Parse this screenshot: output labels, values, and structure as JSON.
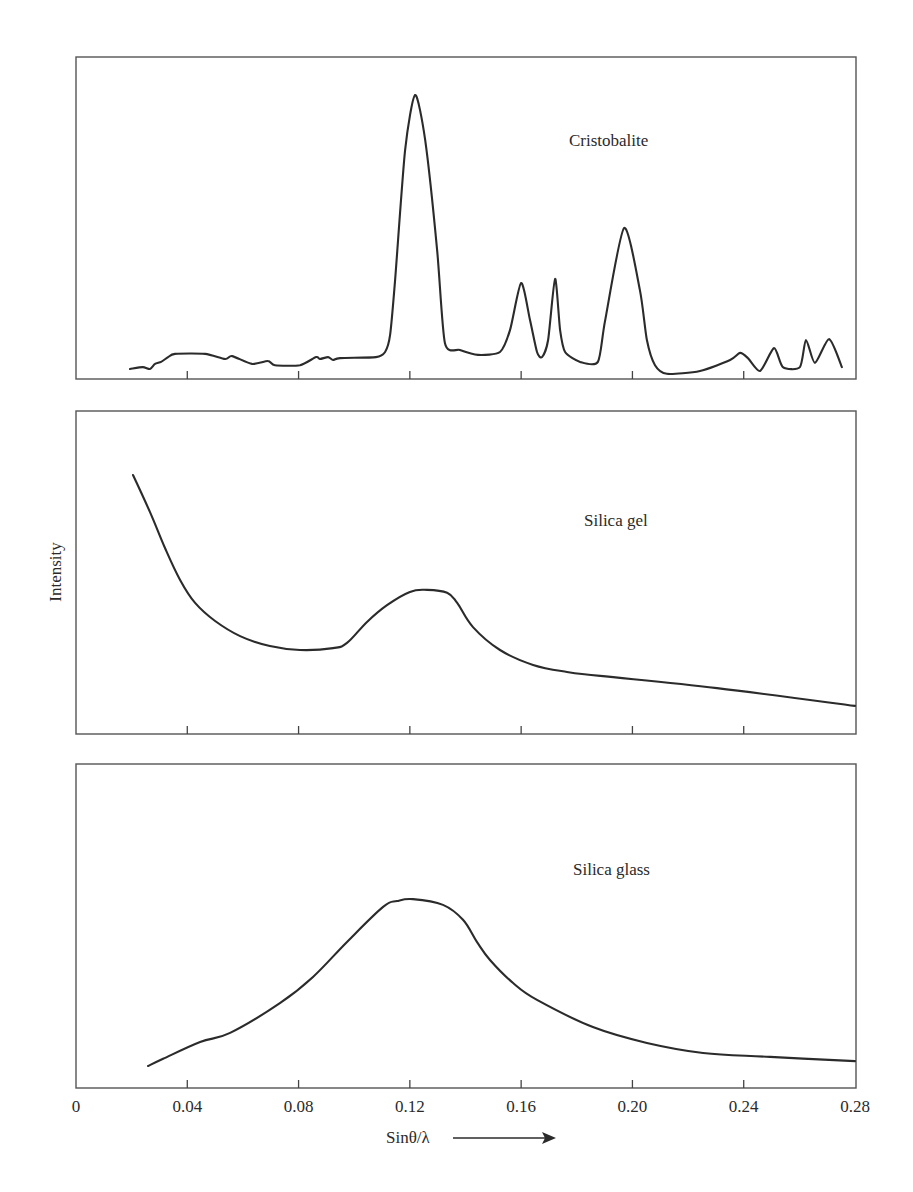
{
  "figure": {
    "ylabel": "Intensity",
    "xlabel": "Sinθ/λ",
    "xlabel_arrow": "right-arrow",
    "x_ticks": [
      "0",
      "0.04",
      "0.08",
      "0.12",
      "0.16",
      "0.20",
      "0.24",
      "0.28"
    ],
    "x_tick_values": [
      0,
      0.04,
      0.08,
      0.12,
      0.16,
      0.2,
      0.24,
      0.28
    ],
    "line_color": "#2b2b2b",
    "frame_color": "#555555"
  },
  "chart_data": {
    "type": "line",
    "title": "",
    "xlabel": "Sinθ/λ",
    "ylabel": "Intensity",
    "xlim": [
      0,
      0.28
    ],
    "ylim": [
      0,
      1
    ],
    "grid": false,
    "legend": "none (panel text labels)",
    "layout": "three vertically stacked panels sharing x-axis; y-axis unscaled relative intensity",
    "x_tick_labels": [
      "0",
      "0.04",
      "0.08",
      "0.12",
      "0.16",
      "0.20",
      "0.24",
      "0.28"
    ],
    "panels": [
      {
        "name": "Cristobalite",
        "label": "Cristobalite",
        "label_pos": [
          0.176,
          0.74
        ],
        "points": [
          [
            0.0194,
            0.031
          ],
          [
            0.024,
            0.037
          ],
          [
            0.0266,
            0.031
          ],
          [
            0.0284,
            0.047
          ],
          [
            0.0306,
            0.053
          ],
          [
            0.0331,
            0.068
          ],
          [
            0.0356,
            0.078
          ],
          [
            0.0464,
            0.078
          ],
          [
            0.0536,
            0.062
          ],
          [
            0.0561,
            0.071
          ],
          [
            0.0633,
            0.047
          ],
          [
            0.069,
            0.056
          ],
          [
            0.0715,
            0.043
          ],
          [
            0.0805,
            0.043
          ],
          [
            0.0863,
            0.068
          ],
          [
            0.0877,
            0.062
          ],
          [
            0.0906,
            0.068
          ],
          [
            0.0924,
            0.059
          ],
          [
            0.0949,
            0.065
          ],
          [
            0.1078,
            0.068
          ],
          [
            0.1111,
            0.084
          ],
          [
            0.1129,
            0.137
          ],
          [
            0.1147,
            0.307
          ],
          [
            0.1183,
            0.711
          ],
          [
            0.1219,
            0.882
          ],
          [
            0.1255,
            0.742
          ],
          [
            0.1298,
            0.401
          ],
          [
            0.1326,
            0.112
          ],
          [
            0.138,
            0.09
          ],
          [
            0.1445,
            0.075
          ],
          [
            0.1524,
            0.084
          ],
          [
            0.156,
            0.152
          ],
          [
            0.16,
            0.298
          ],
          [
            0.1632,
            0.183
          ],
          [
            0.1657,
            0.084
          ],
          [
            0.1675,
            0.068
          ],
          [
            0.1697,
            0.121
          ],
          [
            0.1722,
            0.311
          ],
          [
            0.174,
            0.152
          ],
          [
            0.1758,
            0.084
          ],
          [
            0.1812,
            0.053
          ],
          [
            0.1876,
            0.053
          ],
          [
            0.1902,
            0.183
          ],
          [
            0.197,
            0.469
          ],
          [
            0.2027,
            0.276
          ],
          [
            0.2052,
            0.121
          ],
          [
            0.2081,
            0.043
          ],
          [
            0.2124,
            0.016
          ],
          [
            0.2243,
            0.025
          ],
          [
            0.2351,
            0.059
          ],
          [
            0.2387,
            0.081
          ],
          [
            0.2415,
            0.065
          ],
          [
            0.2459,
            0.025
          ],
          [
            0.2509,
            0.096
          ],
          [
            0.2541,
            0.037
          ],
          [
            0.2602,
            0.037
          ],
          [
            0.2624,
            0.121
          ],
          [
            0.2656,
            0.05
          ],
          [
            0.2707,
            0.124
          ],
          [
            0.2753,
            0.037
          ]
        ],
        "peaks": [
          {
            "x": 0.122,
            "y": 0.88
          },
          {
            "x": 0.16,
            "y": 0.3
          },
          {
            "x": 0.172,
            "y": 0.31
          },
          {
            "x": 0.197,
            "y": 0.47
          },
          {
            "x": 0.239,
            "y": 0.08
          },
          {
            "x": 0.251,
            "y": 0.1
          },
          {
            "x": 0.262,
            "y": 0.12
          },
          {
            "x": 0.271,
            "y": 0.12
          }
        ]
      },
      {
        "name": "Silica gel",
        "label": "Silica gel",
        "label_pos": [
          0.183,
          0.645
        ],
        "points": [
          [
            0.0205,
            0.802
          ],
          [
            0.0266,
            0.687
          ],
          [
            0.032,
            0.576
          ],
          [
            0.0374,
            0.477
          ],
          [
            0.0428,
            0.406
          ],
          [
            0.05,
            0.35
          ],
          [
            0.059,
            0.303
          ],
          [
            0.0697,
            0.272
          ],
          [
            0.0805,
            0.26
          ],
          [
            0.0924,
            0.266
          ],
          [
            0.0974,
            0.282
          ],
          [
            0.1046,
            0.347
          ],
          [
            0.1118,
            0.399
          ],
          [
            0.12,
            0.44
          ],
          [
            0.1262,
            0.446
          ],
          [
            0.1334,
            0.437
          ],
          [
            0.137,
            0.406
          ],
          [
            0.1427,
            0.331
          ],
          [
            0.1524,
            0.26
          ],
          [
            0.1643,
            0.214
          ],
          [
            0.1765,
            0.192
          ],
          [
            0.1884,
            0.18
          ],
          [
            0.2304,
            0.142
          ],
          [
            0.28,
            0.087
          ]
        ],
        "peaks": [
          {
            "x": 0.126,
            "y": 0.45
          }
        ]
      },
      {
        "name": "Silica glass",
        "label": "Silica glass",
        "label_pos": [
          0.179,
          0.655
        ],
        "points": [
          [
            0.0259,
            0.068
          ],
          [
            0.0313,
            0.09
          ],
          [
            0.0446,
            0.142
          ],
          [
            0.0554,
            0.17
          ],
          [
            0.0733,
            0.262
          ],
          [
            0.0852,
            0.343
          ],
          [
            0.0974,
            0.451
          ],
          [
            0.1104,
            0.559
          ],
          [
            0.1154,
            0.577
          ],
          [
            0.1211,
            0.583
          ],
          [
            0.1319,
            0.565
          ],
          [
            0.1391,
            0.519
          ],
          [
            0.1441,
            0.451
          ],
          [
            0.1488,
            0.395
          ],
          [
            0.1571,
            0.324
          ],
          [
            0.1657,
            0.272
          ],
          [
            0.1858,
            0.188
          ],
          [
            0.2052,
            0.139
          ],
          [
            0.2254,
            0.108
          ],
          [
            0.2495,
            0.096
          ],
          [
            0.28,
            0.083
          ]
        ],
        "peaks": [
          {
            "x": 0.121,
            "y": 0.58
          }
        ]
      }
    ]
  }
}
